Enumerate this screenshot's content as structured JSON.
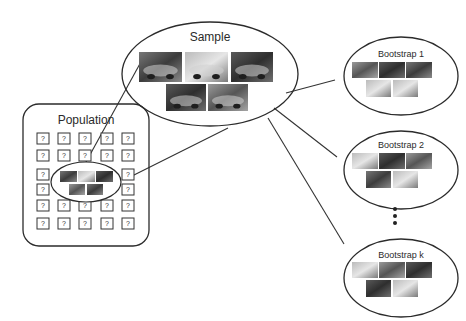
{
  "diagram": {
    "population": {
      "label": "Population",
      "unknown_symbol": "?",
      "grid_rows": 6,
      "grid_cols": 5
    },
    "sample": {
      "label": "Sample",
      "image_count": 5
    },
    "bootstraps": [
      {
        "label": "Bootstrap 1",
        "image_count": 5
      },
      {
        "label": "Bootstrap 2",
        "image_count": 5
      },
      {
        "label": "Bootstrap k",
        "image_count": 5
      }
    ],
    "ellipsis": "⋮",
    "colors": {
      "stroke": "#2b2b2b",
      "background": "#ffffff",
      "thumbnail_dark": "#4a4a4a",
      "thumbnail_light": "#9a9a9a"
    }
  }
}
